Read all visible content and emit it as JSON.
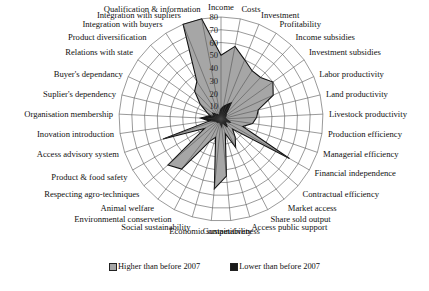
{
  "chart_data": {
    "type": "radar",
    "title": "",
    "center": [
      221,
      119
    ],
    "radius_px": 102,
    "r_max": 80,
    "ticks": [
      10,
      20,
      30,
      40,
      50,
      60,
      70,
      80
    ],
    "grid": true,
    "legend_position": "bottom",
    "categories": [
      "Income",
      "Costs",
      "Investment",
      "Profitability",
      "Income subsidies",
      "Investment subsidies",
      "Labor productivity",
      "Land productivity",
      "Livestock productivity",
      "Production efficiency",
      "Managerial efficiency",
      "Financial independence",
      "Contractual efficiency",
      "Market access",
      "Share sold output",
      "Access public support",
      "Competitiveness",
      "Economic sustainability",
      "Social sustainability",
      "Environmental conservetion",
      "Animal welfare",
      "Respecting agro-techniques",
      "Product & food safety",
      "Access advisory system",
      "Inovation introduction",
      "Organisation membership",
      "Suplier's dependency",
      "Buyer's dependancy",
      "Relations with state",
      "Product diversification",
      "Integration with buyers",
      "Integration with supliers",
      "Qualification & information"
    ],
    "series": [
      {
        "name": "Higher than before 2007",
        "color": "#a6a6a6",
        "values": [
          50,
          58,
          50,
          45,
          45,
          50,
          45,
          30,
          28,
          25,
          18,
          62,
          12,
          18,
          25,
          12,
          45,
          55,
          15,
          20,
          50,
          55,
          15,
          48,
          8,
          10,
          8,
          12,
          20,
          30,
          35,
          80,
          80
        ]
      },
      {
        "name": "Lower than before 2007",
        "color": "#1a1a1a",
        "values": [
          8,
          10,
          12,
          15,
          6,
          5,
          4,
          3,
          4,
          5,
          8,
          4,
          5,
          8,
          4,
          3,
          6,
          4,
          3,
          3,
          3,
          4,
          4,
          5,
          10,
          16,
          10,
          6,
          8,
          5,
          4,
          3,
          5
        ]
      }
    ]
  },
  "legend": {
    "items": [
      {
        "label": "Higher than before 2007",
        "color": "#a6a6a6"
      },
      {
        "label": "Lower than before 2007",
        "color": "#1a1a1a"
      }
    ]
  }
}
